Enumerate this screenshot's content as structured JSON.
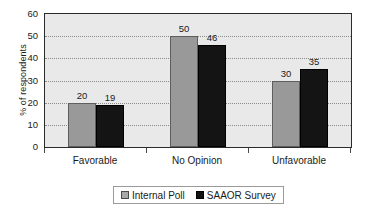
{
  "chart_data": {
    "type": "bar",
    "title": "",
    "xlabel": "",
    "ylabel": "% of respondents",
    "categories": [
      "Favorable",
      "No Opinion",
      "Unfavorable"
    ],
    "series": [
      {
        "name": "Internal Poll",
        "values": [
          20,
          19,
          50
        ],
        "color": "#999999"
      },
      {
        "name": "SAAOR Survey",
        "values": [
          19,
          46,
          35
        ],
        "color": "#141414"
      }
    ],
    "ylim": [
      0,
      60
    ],
    "yticks": [
      0,
      10,
      20,
      30,
      40,
      50,
      60
    ],
    "ytick_labels": [
      "0",
      "10",
      "20",
      "30",
      "40",
      "50",
      "60"
    ],
    "grid": true,
    "grid_style": "dotted-horizontal",
    "legend_position": "bottom-center",
    "data_labels": true,
    "plot_background": "#e9e9e9",
    "figure_background": "#ffffff"
  },
  "series_data": [
    {
      "name": "Internal Poll",
      "values": [
        20,
        50,
        30
      ]
    },
    {
      "name": "SAAOR Survey",
      "values": [
        19,
        46,
        35
      ]
    }
  ],
  "legend": {
    "entries": [
      {
        "label": "Internal Poll",
        "swatch": "gray-swatch-icon"
      },
      {
        "label": "SAAOR Survey",
        "swatch": "black-swatch-icon"
      }
    ]
  },
  "axes": {
    "y_title": "% of respondents",
    "y_tick_labels": [
      "60",
      "50",
      "40",
      "30",
      "20",
      "10",
      "0"
    ],
    "x_tick_labels": [
      "Favorable",
      "No Opinion",
      "Unfavorable"
    ]
  },
  "bar_labels": [
    [
      "20",
      "19"
    ],
    [
      "50",
      "46"
    ],
    [
      "30",
      "35"
    ]
  ]
}
